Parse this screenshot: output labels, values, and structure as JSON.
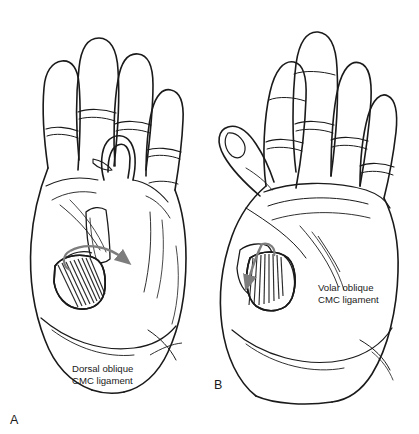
{
  "figure": {
    "type": "anatomical-line-illustration",
    "background_color": "#ffffff",
    "ink_color": "#1a1a1a",
    "arrow_color": "#7d7d7d",
    "hatch_color": "#2b2b2b"
  },
  "panels": [
    {
      "id": "A",
      "panel_label": "A",
      "view": "dorsal",
      "label_lines": [
        "Dorsal oblique",
        "CMC ligament"
      ],
      "label_text": "Dorsal oblique CMC ligament",
      "arrow_direction": "rightward-curved",
      "ligament_name": "Dorsal oblique CMC ligament"
    },
    {
      "id": "B",
      "panel_label": "B",
      "view": "volar",
      "label_lines": [
        "Volar oblique",
        "CMC ligament"
      ],
      "label_text": "Volar oblique CMC ligament",
      "arrow_direction": "downward-curved",
      "ligament_name": "Volar oblique CMC ligament"
    }
  ]
}
